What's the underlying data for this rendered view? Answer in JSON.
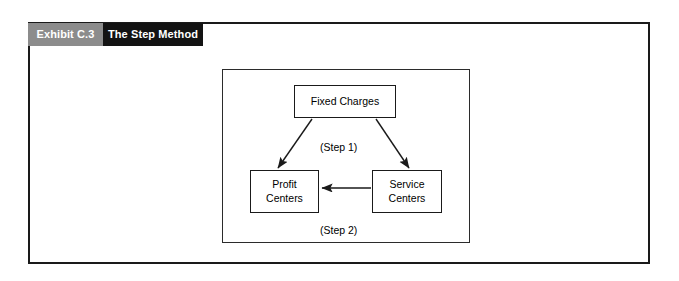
{
  "exhibit": {
    "number": "Exhibit C.3",
    "title": "The Step Method"
  },
  "colors": {
    "number_band": "#8c8c8c",
    "title_band": "#131313",
    "frame_border": "#1a1a1a",
    "panel_border": "#2b2b2b",
    "node_border": "#1a1a1a",
    "arrow": "#1a1a1a",
    "text": "#000000",
    "band_text": "#ffffff",
    "background": "#ffffff"
  },
  "diagram": {
    "type": "flow",
    "nodes": [
      {
        "id": "fixed-charges",
        "label": "Fixed Charges",
        "lines": [
          "Fixed Charges"
        ]
      },
      {
        "id": "profit-centers",
        "label": "Profit Centers",
        "lines": [
          "Profit",
          "Centers"
        ]
      },
      {
        "id": "service-centers",
        "label": "Service Centers",
        "lines": [
          "Service",
          "Centers"
        ]
      }
    ],
    "edges": [
      {
        "id": "edge-step1-left",
        "from": "fixed-charges",
        "to": "profit-centers",
        "label": "(Step 1)",
        "style": "diagonal-arrow"
      },
      {
        "id": "edge-step1-right",
        "from": "fixed-charges",
        "to": "service-centers",
        "label": "(Step 1)",
        "style": "diagonal-arrow"
      },
      {
        "id": "edge-step2",
        "from": "service-centers",
        "to": "profit-centers",
        "label": "(Step 2)",
        "style": "horizontal-arrow"
      }
    ],
    "labels": {
      "step1": "(Step 1)",
      "step2": "(Step 2)"
    }
  }
}
